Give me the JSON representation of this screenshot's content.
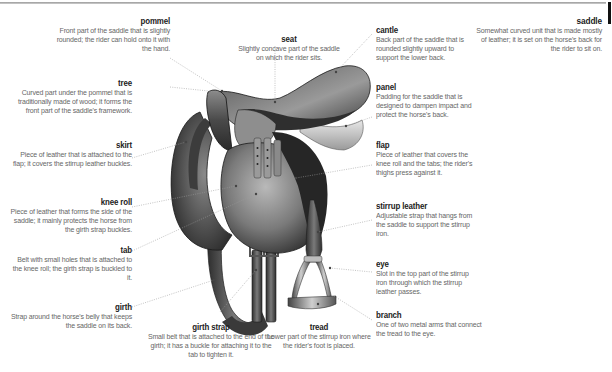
{
  "title": "saddle",
  "entries": {
    "saddle": {
      "term": "saddle",
      "desc": "Somewhat curved unit that is made mostly of leather; it is set on the horse's back for the rider to sit on."
    },
    "pommel": {
      "term": "pommel",
      "desc": "Front part of the saddle that is slightly rounded; the rider can hold onto it with the hand."
    },
    "tree": {
      "term": "tree",
      "desc": "Curved part under the pommel that is traditionally made of wood; it forms the front part of the saddle's framework."
    },
    "skirt": {
      "term": "skirt",
      "desc": "Piece of leather that is attached to the flap; it covers the stirrup leather buckles."
    },
    "knee_roll": {
      "term": "knee roll",
      "desc": "Piece of leather that forms the side of the saddle; it mainly protects the horse from the girth strap buckles."
    },
    "tab": {
      "term": "tab",
      "desc": "Belt with small holes that is attached to the knee roll; the girth strap is buckled to it."
    },
    "girth": {
      "term": "girth",
      "desc": "Strap around the horse's belly that keeps the saddle on its back."
    },
    "girth_strap": {
      "term": "girth strap",
      "desc": "Small belt that is attached to the end of the girth; it has a buckle for attaching it to the tab to tighten it."
    },
    "seat": {
      "term": "seat",
      "desc": "Slightly concave part of the saddle on which the rider sits."
    },
    "tread": {
      "term": "tread",
      "desc": "Lower part of the stirrup iron where the rider's foot is placed."
    },
    "cantle": {
      "term": "cantle",
      "desc": "Back part of the saddle that is rounded slightly upward to support the lower back."
    },
    "panel": {
      "term": "panel",
      "desc": "Padding for the saddle that is designed to dampen impact and protect the horse's back."
    },
    "flap": {
      "term": "flap",
      "desc": "Piece of leather that covers the knee roll and the tabs; the rider's thighs press against it."
    },
    "stirrup_leather": {
      "term": "stirrup leather",
      "desc": "Adjustable strap that hangs from the saddle to support the stirrup iron."
    },
    "eye": {
      "term": "eye",
      "desc": "Slot in the top part of the stirrup iron through which the stirrup leather passes."
    },
    "branch": {
      "term": "branch",
      "desc": "One of two metal arms that connect the tread to the eye."
    }
  },
  "colors": {
    "term": "#222222",
    "desc": "#666666",
    "leader": "#9a9a9a",
    "leather_dark": "#2a2a2a",
    "leather_mid": "#6e6e6e",
    "leather_light": "#b8b8b8"
  }
}
